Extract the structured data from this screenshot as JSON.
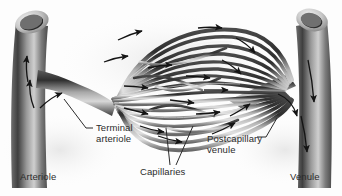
{
  "figure": {
    "type": "anatomical-illustration",
    "style": "grayscale halftone",
    "background_color": "#fdfdfd",
    "ink_color": "#2b2b2b"
  },
  "labels": {
    "arteriole": "Arteriole",
    "terminal_arteriole": "Terminal\narteriole",
    "capillaries": "Capillaries",
    "postcapillary_venule": "Postcapillary\nvenule",
    "venule": "Venule"
  },
  "structures": [
    {
      "name": "arteriole",
      "side": "left",
      "lumen_open": true,
      "flow_direction": "up-and-right"
    },
    {
      "name": "terminal-arteriole",
      "side": "left",
      "flow_direction": "right"
    },
    {
      "name": "capillary-bed",
      "side": "center",
      "shape": "lens",
      "flow_direction": "right"
    },
    {
      "name": "postcapillary-venule",
      "side": "right",
      "flow_direction": "right"
    },
    {
      "name": "venule",
      "side": "right",
      "lumen_open": true,
      "flow_direction": "down"
    }
  ],
  "flow": {
    "arrow_color": "#1a1a1a",
    "overall_direction": "arteriole to venule (left to right)"
  }
}
